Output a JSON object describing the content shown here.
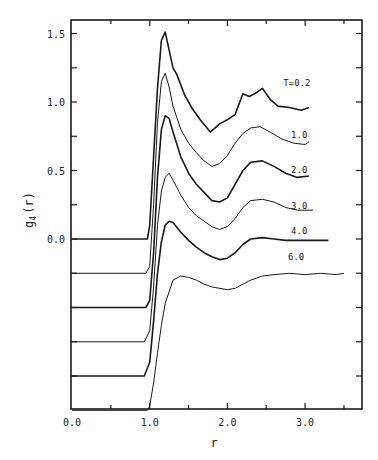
{
  "chart_data": {
    "type": "line",
    "title": "",
    "xlabel": "r",
    "ylabel": "g4(r)",
    "ylabel_main": "g",
    "ylabel_sub": "4",
    "ylabel_arg": "(r)",
    "xlim": [
      0.0,
      3.75
    ],
    "ylim": [
      -1.25,
      1.6
    ],
    "grid": false,
    "legend_position": "inline labels at right end of curves",
    "x_ticks": [
      0.0,
      1.0,
      2.0,
      3.0
    ],
    "x_tick_labels": [
      "0.0",
      "1.0",
      "2.0",
      "3.0"
    ],
    "y_ticks": [
      0.0,
      0.5,
      1.0,
      1.5
    ],
    "y_tick_labels": [
      "0.0",
      "0.5",
      "1.0",
      "1.5"
    ],
    "note": "Curves vertically offset by -0.25 each; values below are the unshifted g4(r)",
    "series": [
      {
        "name": "T=0.2",
        "label": "T=0.2",
        "offset": 0.0,
        "stroke": 1.6,
        "label_pos": [
          2.72,
          1.12
        ],
        "x": [
          0.0,
          0.97,
          1.0,
          1.05,
          1.1,
          1.15,
          1.2,
          1.25,
          1.3,
          1.35,
          1.45,
          1.55,
          1.65,
          1.78,
          1.9,
          2.0,
          2.1,
          2.2,
          2.28,
          2.35,
          2.45,
          2.55,
          2.65,
          2.8,
          2.95,
          3.05
        ],
        "y": [
          0.0,
          0.0,
          0.1,
          0.6,
          1.1,
          1.45,
          1.51,
          1.38,
          1.25,
          1.2,
          1.05,
          0.95,
          0.87,
          0.78,
          0.84,
          0.87,
          0.91,
          1.06,
          1.04,
          1.06,
          1.1,
          1.02,
          0.97,
          0.96,
          0.94,
          0.96
        ]
      },
      {
        "name": "T=1.0",
        "label": "1.0",
        "offset": -0.25,
        "stroke": 1.0,
        "label_pos": [
          2.82,
          0.99
        ],
        "x": [
          0.0,
          0.95,
          1.0,
          1.05,
          1.1,
          1.15,
          1.2,
          1.25,
          1.3,
          1.4,
          1.5,
          1.6,
          1.7,
          1.8,
          1.9,
          2.0,
          2.1,
          2.2,
          2.3,
          2.42,
          2.55,
          2.7,
          2.85,
          3.0,
          3.05
        ],
        "y": [
          0.0,
          0.0,
          0.05,
          0.5,
          1.1,
          1.4,
          1.46,
          1.36,
          1.22,
          1.05,
          0.95,
          0.88,
          0.82,
          0.78,
          0.8,
          0.86,
          0.95,
          1.02,
          1.06,
          1.07,
          1.03,
          0.98,
          0.95,
          0.94,
          0.96
        ]
      },
      {
        "name": "T=2.0",
        "label": "2.0",
        "offset": -0.5,
        "stroke": 1.6,
        "label_pos": [
          2.82,
          0.98
        ],
        "x": [
          0.0,
          0.95,
          1.0,
          1.05,
          1.1,
          1.15,
          1.2,
          1.25,
          1.3,
          1.4,
          1.5,
          1.6,
          1.7,
          1.8,
          1.9,
          2.0,
          2.1,
          2.2,
          2.3,
          2.45,
          2.6,
          2.75,
          2.9,
          3.05
        ],
        "y": [
          0.0,
          0.0,
          0.05,
          0.4,
          0.95,
          1.3,
          1.4,
          1.38,
          1.28,
          1.1,
          0.98,
          0.9,
          0.84,
          0.78,
          0.77,
          0.8,
          0.9,
          1.0,
          1.06,
          1.07,
          1.03,
          0.98,
          0.95,
          0.96
        ]
      },
      {
        "name": "T=3.0",
        "label": "3.0",
        "offset": -0.75,
        "stroke": 1.0,
        "label_pos": [
          2.82,
          0.97
        ],
        "x": [
          0.0,
          0.93,
          1.0,
          1.05,
          1.1,
          1.15,
          1.2,
          1.25,
          1.3,
          1.4,
          1.5,
          1.6,
          1.7,
          1.8,
          1.9,
          2.0,
          2.1,
          2.2,
          2.3,
          2.45,
          2.6,
          2.75,
          2.9,
          3.1
        ],
        "y": [
          0.0,
          0.0,
          0.08,
          0.4,
          0.85,
          1.1,
          1.2,
          1.23,
          1.18,
          1.07,
          0.98,
          0.92,
          0.88,
          0.84,
          0.82,
          0.84,
          0.9,
          0.98,
          1.03,
          1.04,
          1.02,
          0.98,
          0.96,
          0.96
        ]
      },
      {
        "name": "T=4.0",
        "label": "4.0",
        "offset": -1.0,
        "stroke": 1.6,
        "label_pos": [
          2.82,
          1.04
        ],
        "x": [
          0.0,
          0.93,
          1.0,
          1.05,
          1.1,
          1.15,
          1.2,
          1.25,
          1.3,
          1.4,
          1.5,
          1.6,
          1.7,
          1.8,
          1.9,
          2.0,
          2.1,
          2.2,
          2.3,
          2.45,
          2.6,
          2.75,
          2.9,
          3.1,
          3.3
        ],
        "y": [
          0.0,
          0.0,
          0.1,
          0.4,
          0.75,
          0.98,
          1.1,
          1.13,
          1.12,
          1.05,
          0.99,
          0.94,
          0.9,
          0.87,
          0.85,
          0.86,
          0.9,
          0.96,
          1.0,
          1.01,
          1.0,
          0.99,
          0.99,
          0.99,
          0.99
        ]
      },
      {
        "name": "T=6.0",
        "label": "6.0",
        "offset": -1.25,
        "stroke": 1.0,
        "label_pos": [
          2.78,
          1.1
        ],
        "x": [
          0.0,
          0.97,
          1.0,
          1.05,
          1.1,
          1.15,
          1.2,
          1.3,
          1.4,
          1.5,
          1.6,
          1.7,
          1.8,
          1.9,
          2.0,
          2.1,
          2.2,
          2.3,
          2.45,
          2.6,
          2.8,
          3.0,
          3.2,
          3.4,
          3.5
        ],
        "y": [
          0.0,
          0.0,
          0.03,
          0.2,
          0.42,
          0.62,
          0.78,
          0.95,
          0.98,
          0.97,
          0.95,
          0.92,
          0.9,
          0.89,
          0.88,
          0.89,
          0.92,
          0.95,
          0.98,
          0.99,
          1.0,
          0.99,
          1.0,
          0.99,
          1.0
        ]
      }
    ]
  }
}
